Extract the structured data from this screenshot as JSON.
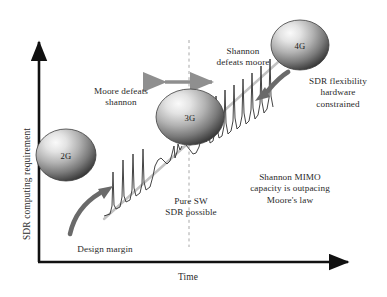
{
  "figure": {
    "type": "conceptual-diagram",
    "axes": {
      "y_label": "SDR computing requirement",
      "x_label": "Time"
    },
    "nodes": [
      {
        "id": "2g",
        "label": "2G",
        "cx": 66,
        "cy": 155,
        "rx": 30,
        "ry": 26
      },
      {
        "id": "3g",
        "label": "3G",
        "cx": 190,
        "cy": 117,
        "rx": 34,
        "ry": 28
      },
      {
        "id": "4g",
        "label": "4G",
        "cx": 300,
        "cy": 45,
        "rx": 29,
        "ry": 25
      }
    ],
    "annotations": [
      {
        "id": "moore-defeats-shannon",
        "text": "Moore defeats\nshannon",
        "x": 76,
        "y": 86
      },
      {
        "id": "shannon-defeats-moore",
        "text": "Shannon\ndefeats moore",
        "x": 198,
        "y": 46
      },
      {
        "id": "sdr-flexibility",
        "text": "SDR flexibility\nhardware\nconstrained",
        "x": 292,
        "y": 76
      },
      {
        "id": "shannon-mimo",
        "text": "Shannon MIMO\ncapacity is outpacing\nMoore's law",
        "x": 290,
        "y": 172
      },
      {
        "id": "pure-sw-sdr",
        "text": "Pure SW\nSDR possible",
        "x": 160,
        "y": 196
      },
      {
        "id": "design-margin",
        "text": "Design margin",
        "x": 105,
        "y": 244
      }
    ],
    "colors": {
      "axis": "#111111",
      "trend_line": "#b9b9b9",
      "arrow": "#6a6a6a",
      "double_arrow": "#8f8f8f",
      "waveform": "#3a3a3a",
      "dashed_guide": "#a8a8a8",
      "sphere_light": "#f2f2f2",
      "sphere_dark": "#2e2e2e",
      "text": "#2a2a2a",
      "background": "#ffffff"
    }
  }
}
